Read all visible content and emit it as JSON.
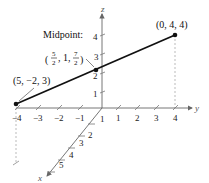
{
  "diagram": {
    "type": "3d-coordinate-plot",
    "axes": {
      "x": {
        "label": "x",
        "ticks": [
          "1",
          "2",
          "3",
          "4",
          "5"
        ]
      },
      "y": {
        "label": "y",
        "ticks": [
          "−4",
          "−3",
          "−2",
          "−1",
          "1",
          "2",
          "3",
          "4"
        ]
      },
      "z": {
        "label": "z",
        "ticks": [
          "1",
          "2",
          "3",
          "4"
        ]
      }
    },
    "points": [
      {
        "label": "(5, −2, 3)",
        "coords": [
          5,
          -2,
          3
        ]
      },
      {
        "label": "(0, 4, 4)",
        "coords": [
          0,
          4,
          4
        ]
      }
    ],
    "midpoint": {
      "title": "Midpoint:",
      "x_num": "5",
      "x_den": "2",
      "y_val": "1",
      "z_num": "7",
      "z_den": "2",
      "coords": [
        2.5,
        1,
        3.5
      ]
    },
    "colors": {
      "segment": "#111111",
      "axis": "#666666",
      "dashed": "#999999"
    }
  }
}
